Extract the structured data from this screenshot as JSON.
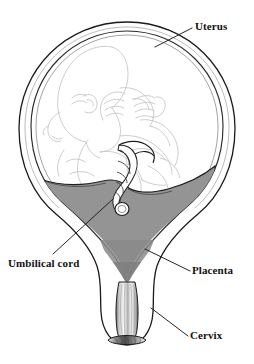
{
  "figure": {
    "background_color": "#ffffff",
    "width": 254,
    "height": 364
  },
  "colors": {
    "outline": "#1a1a1a",
    "placenta_fill": "#949494",
    "placenta_fill_dark": "#7d7d7d",
    "fetus_line": "#c2c2c2",
    "uterus_wall_fill": "#ffffff",
    "cervix_shading": "#b5b5b5",
    "label_text": "#111111",
    "leader_line": "#1a1a1a"
  },
  "labels": [
    {
      "id": "uterus",
      "text": "Uterus",
      "leader": {
        "x1": 155,
        "y1": 47,
        "x2": 192,
        "y2": 28
      }
    },
    {
      "id": "placenta",
      "text": "Placenta",
      "leader": {
        "x1": 145,
        "y1": 249,
        "x2": 190,
        "y2": 271
      }
    },
    {
      "id": "cervix",
      "text": "Cervix",
      "leader": {
        "x1": 151,
        "y1": 308,
        "x2": 188,
        "y2": 336
      }
    },
    {
      "id": "umbilical_cord",
      "text": "Umbilical cord",
      "leader": {
        "x1": 113,
        "y1": 199,
        "x2": 53,
        "y2": 254
      }
    }
  ],
  "structures": [
    {
      "name": "uterus",
      "description": "Outer muscular wall drawn as a double contour pear shape"
    },
    {
      "name": "amniotic_cavity",
      "description": "Inner cavity containing the fetus"
    },
    {
      "name": "fetus",
      "description": "Fetus drawn in pale line art, head down-left, limbs flexed"
    },
    {
      "name": "placenta",
      "description": "Grey V shaped mass lining the lower uterine cavity"
    },
    {
      "name": "umbilical_cord",
      "description": "Twisted cord running from placenta to fetal abdomen"
    },
    {
      "name": "cervix",
      "description": "Narrow shaded canal at the base of the uterus"
    }
  ]
}
